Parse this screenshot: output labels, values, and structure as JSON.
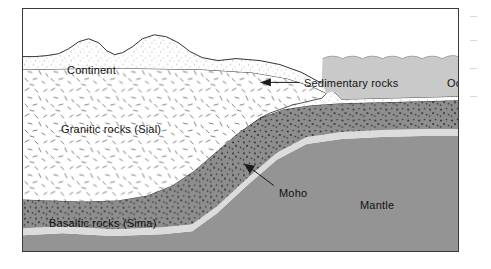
{
  "figure": {
    "type": "geological-cross-section",
    "title_visible": false,
    "border_color": "#3a3a3a",
    "background": "#ffffff"
  },
  "labels": {
    "continent": "Continent",
    "sedimentary": "Sedimentary rocks",
    "ocean": "Ocean",
    "granitic": "Granitic rocks (Sial)",
    "basaltic": "Basaltic rocks (Sima)",
    "moho": "Moho",
    "mantle": "Mantle"
  },
  "layers": [
    {
      "name": "continent-surface",
      "label": "Continent",
      "description": "irregular mountainous land surface with fine stipple texture",
      "fill": "#ffffff",
      "texture": "fine-stipple"
    },
    {
      "name": "ocean-water",
      "label": "Ocean",
      "description": "gray water body with scalloped wave surface on the right side",
      "fill": "#c9c9c9",
      "texture": "none"
    },
    {
      "name": "sedimentary-rocks",
      "label": "Sedimentary rocks",
      "description": "thin white wedge layer between continent and basaltic crust, thickening at the continental margin",
      "fill": "#ffffff",
      "texture": "fine-stipple"
    },
    {
      "name": "granitic-rocks",
      "label": "Granitic rocks (Sial)",
      "description": "thick white continental crust with randomly oriented dash texture, tapering to the right",
      "fill": "#ffffff",
      "texture": "random-dashes"
    },
    {
      "name": "basaltic-rocks",
      "label": "Basaltic rocks (Sima)",
      "description": "medium gray oceanic crust with dark stipple dots, rising from left to right",
      "fill": "#8e8e8e",
      "texture": "dense-dots"
    },
    {
      "name": "moho-boundary",
      "label": "Moho",
      "description": "thin light band marking the crust-mantle discontinuity",
      "fill": "#dcdcdc",
      "texture": "none"
    },
    {
      "name": "mantle",
      "label": "Mantle",
      "description": "uniform gray region beneath the Moho",
      "fill": "#949494",
      "texture": "none"
    }
  ],
  "annotations": [
    {
      "name": "sedimentary-leader",
      "target": "sedimentary-rocks",
      "arrow_direction": "left",
      "label": "Sedimentary rocks"
    },
    {
      "name": "moho-leader",
      "target": "moho-boundary",
      "arrow_direction": "up-left",
      "label": "Moho"
    }
  ],
  "colors": {
    "ocean": "#c9c9c9",
    "basalt": "#8e8e8e",
    "mantle": "#949494",
    "moho": "#dcdcdc",
    "outline": "#1a1a1a",
    "border": "#3a3a3a",
    "text": "#111111"
  }
}
